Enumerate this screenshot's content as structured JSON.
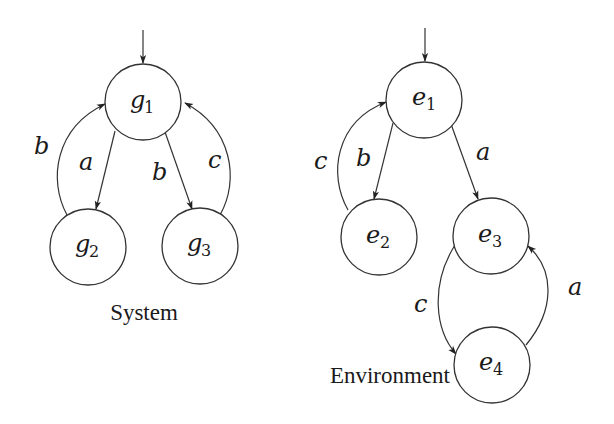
{
  "diagrams": [
    {
      "caption": "System",
      "nodes": [
        {
          "id": "g1",
          "base": "g",
          "sub": "1",
          "initial": true
        },
        {
          "id": "g2",
          "base": "g",
          "sub": "2"
        },
        {
          "id": "g3",
          "base": "g",
          "sub": "3"
        }
      ],
      "edges": [
        {
          "from": "g1",
          "to": "g2",
          "label": "a"
        },
        {
          "from": "g2",
          "to": "g1",
          "label": "b"
        },
        {
          "from": "g1",
          "to": "g3",
          "label": "b"
        },
        {
          "from": "g3",
          "to": "g1",
          "label": "c"
        }
      ]
    },
    {
      "caption": "Environment",
      "nodes": [
        {
          "id": "e1",
          "base": "e",
          "sub": "1",
          "initial": true
        },
        {
          "id": "e2",
          "base": "e",
          "sub": "2"
        },
        {
          "id": "e3",
          "base": "e",
          "sub": "3"
        },
        {
          "id": "e4",
          "base": "e",
          "sub": "4"
        }
      ],
      "edges": [
        {
          "from": "e1",
          "to": "e2",
          "label": "b"
        },
        {
          "from": "e2",
          "to": "e1",
          "label": "c"
        },
        {
          "from": "e1",
          "to": "e3",
          "label": "a"
        },
        {
          "from": "e3",
          "to": "e4",
          "label": "c"
        },
        {
          "from": "e4",
          "to": "e3",
          "label": "a"
        }
      ]
    }
  ]
}
